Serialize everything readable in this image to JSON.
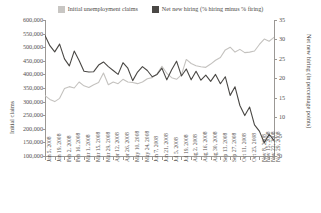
{
  "legend": {
    "items": [
      {
        "label": "Initial unemployment claims",
        "color": "#c8c6c3",
        "swatch_name": "legend-swatch-claims"
      },
      {
        "label": "Net new hiring (% hiring minus % firing)",
        "color": "#4a4845",
        "swatch_name": "legend-swatch-hiring"
      }
    ]
  },
  "chart_data": {
    "type": "line",
    "title": "",
    "xlabel": "",
    "grid": false,
    "legend_position": "top-center",
    "x": [
      "Jan 5, 2008",
      "Jan 12, 2008",
      "Jan 19, 2008",
      "Jan 26, 2008",
      "Feb 2, 2008",
      "Feb 9, 2008",
      "Feb 16, 2008",
      "Feb 23, 2008",
      "Mar 1, 2008",
      "Mar 8, 2008",
      "Mar 15, 2008",
      "Mar 22, 2008",
      "Mar 29, 2008",
      "Apr 5, 2008",
      "Apr 12, 2008",
      "Apr 19, 2008",
      "Apr 26, 2008",
      "May 3, 2008",
      "May 10, 2008",
      "May 17, 2008",
      "May 24, 2008",
      "May 31, 2008",
      "Jun 7, 2008",
      "Jun 14, 2008",
      "Jun 21, 2008",
      "Jun 28, 2008",
      "Jul 5, 2008",
      "Jul 12, 2008",
      "Jul 19, 2008",
      "Jul 26, 2008",
      "Aug 2, 2008",
      "Aug 9, 2008",
      "Aug 16, 2008",
      "Aug 23, 2008",
      "Aug 30, 2008",
      "Sep 6, 2008",
      "Sep 13, 2008",
      "Sep 20, 2008",
      "Sep 27, 2008",
      "Oct 4, 2008",
      "Oct 11, 2008",
      "Oct 18, 2008",
      "Oct 25, 2008",
      "Nov 1, 2008",
      "Nov 8, 2008",
      "Nov 15, 2008",
      "Nov 22, 2008",
      "Nov 29, 2008"
    ],
    "xticks": [
      "Jan 5, 2008",
      "Jan 19, 2008",
      "Feb 2, 2008",
      "Feb 16, 2008",
      "Mar 1, 2008",
      "Mar 15, 2008",
      "Mar 29, 2008",
      "Apr 12, 2008",
      "Apr 26, 2008",
      "May 10, 2008",
      "May 24, 2008",
      "Jun 7, 2008",
      "Jun 21, 2008",
      "Jul 5, 2008",
      "Jul 19, 2008",
      "Aug 2, 2008",
      "Aug 16, 2008",
      "Aug 30, 2008",
      "Sep 13, 2008",
      "Sep 27, 2008",
      "Oct 11, 2008",
      "Oct 25, 2008",
      "Nov 8, 2008",
      "Nov 15, 2008",
      "Nov 22, 2008",
      "Nov 29, 2008"
    ],
    "axes": {
      "left": {
        "label": "Initial claims",
        "ticks": [
          600000,
          550000,
          500000,
          450000,
          400000,
          350000,
          300000,
          250000,
          200000,
          150000,
          100000
        ],
        "tick_labels": [
          "600,000",
          "550,000",
          "500,000",
          "450,000",
          "400,000",
          "350,000",
          "300,000",
          "250,000",
          "200,000",
          "150,000",
          "100,000"
        ],
        "ylim": [
          100000,
          600000
        ]
      },
      "right": {
        "label": "Net new hiring (in percentage points)",
        "ticks": [
          35,
          30,
          25,
          20,
          15,
          10,
          5,
          0
        ],
        "tick_labels": [
          "35",
          "30",
          "25",
          "20",
          "15",
          "10",
          "5",
          "0"
        ],
        "ylim": [
          0,
          35
        ]
      }
    },
    "series": [
      {
        "name": "Initial unemployment claims",
        "axis": "left",
        "color": "#c4c2bf",
        "values": [
          322000,
          308000,
          300000,
          312000,
          348000,
          355000,
          350000,
          372000,
          358000,
          352000,
          362000,
          370000,
          405000,
          362000,
          372000,
          366000,
          382000,
          372000,
          370000,
          366000,
          372000,
          384000,
          388000,
          402000,
          430000,
          404000,
          388000,
          382000,
          398000,
          455000,
          440000,
          432000,
          428000,
          426000,
          438000,
          452000,
          462000,
          490000,
          500000,
          482000,
          492000,
          480000,
          482000,
          486000,
          510000,
          530000,
          522000,
          536000
        ]
      },
      {
        "name": "Net new hiring (% hiring minus % firing)",
        "axis": "right",
        "color": "#4a4845",
        "values": [
          31.0,
          28.4,
          26.8,
          28.8,
          25.0,
          23.2,
          27.0,
          24.6,
          21.8,
          21.6,
          21.7,
          23.4,
          24.2,
          23.0,
          22.0,
          21.0,
          24.0,
          22.6,
          19.4,
          21.6,
          23.0,
          22.0,
          20.4,
          21.0,
          22.6,
          19.6,
          22.2,
          24.4,
          20.6,
          22.4,
          19.6,
          21.8,
          19.5,
          20.8,
          19.2,
          21.0,
          18.6,
          20.4,
          15.6,
          17.8,
          13.0,
          10.4,
          12.6,
          8.0,
          6.4,
          3.4,
          5.6,
          4.0
        ]
      }
    ]
  }
}
